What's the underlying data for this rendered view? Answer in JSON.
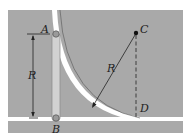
{
  "figure": {
    "colors": {
      "background": "#ffffff",
      "panel": "#a9a9a9",
      "slot": "#ffffff",
      "rod": "#d2d2d2",
      "line": "#222222"
    },
    "labels": {
      "A": "A",
      "B": "B",
      "C": "C",
      "D": "D",
      "R_left": "R",
      "R_radius": "R"
    }
  }
}
